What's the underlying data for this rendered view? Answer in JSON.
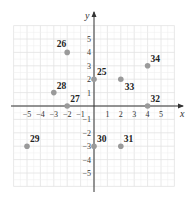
{
  "chart_data": {
    "type": "scatter",
    "title": "",
    "xlabel": "x",
    "ylabel": "y",
    "xlim": [
      -6,
      6
    ],
    "ylim": [
      -6,
      6
    ],
    "grid": true,
    "x_ticks": [
      -5,
      -4,
      -3,
      -2,
      -1,
      1,
      2,
      3,
      4,
      5
    ],
    "y_ticks": [
      -5,
      -4,
      -3,
      -2,
      -1,
      1,
      2,
      3,
      4,
      5
    ],
    "x_tick_labels": [
      "−5",
      "−4",
      "−3",
      "−2",
      "−1",
      "1",
      "2",
      "3",
      "4",
      "5"
    ],
    "y_tick_labels": [
      "−5",
      "−4",
      "−3",
      "−2",
      "−1",
      "1",
      "2",
      "3",
      "4",
      "5"
    ],
    "points": [
      {
        "label": "25",
        "x": 0,
        "y": 2,
        "label_pos": "upper-right"
      },
      {
        "label": "26",
        "x": -2,
        "y": 4,
        "label_pos": "upper-left"
      },
      {
        "label": "27",
        "x": -2,
        "y": 0,
        "label_pos": "upper-right"
      },
      {
        "label": "28",
        "x": -3,
        "y": 1,
        "label_pos": "upper-right"
      },
      {
        "label": "29",
        "x": -5,
        "y": -3,
        "label_pos": "upper-right"
      },
      {
        "label": "30",
        "x": 0,
        "y": -3,
        "label_pos": "upper-right"
      },
      {
        "label": "31",
        "x": 2,
        "y": -3,
        "label_pos": "upper-right"
      },
      {
        "label": "32",
        "x": 4,
        "y": 0,
        "label_pos": "upper-right"
      },
      {
        "label": "33",
        "x": 2,
        "y": 2,
        "label_pos": "lower-right"
      },
      {
        "label": "34",
        "x": 4,
        "y": 3,
        "label_pos": "upper-right"
      }
    ],
    "colors": {
      "point": "#9a9a9a",
      "grid": "#e2e2e2",
      "axis": "#333333"
    }
  }
}
